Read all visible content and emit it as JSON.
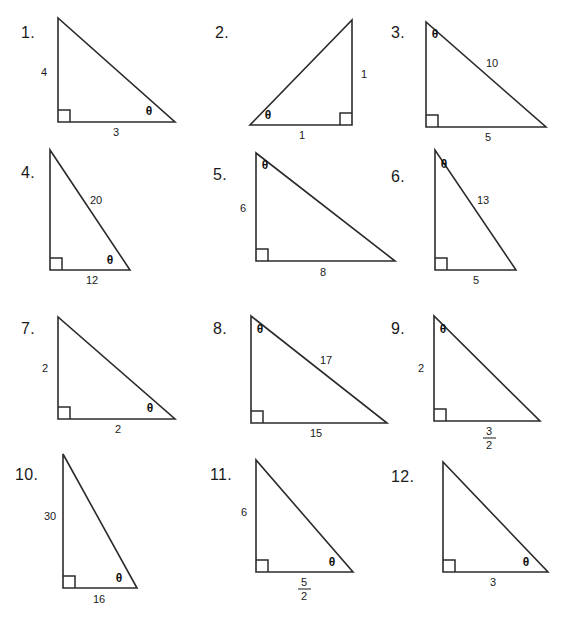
{
  "worksheet": {
    "title": "Right Triangle Trigonometry Practice",
    "theta_symbol": "θ",
    "problems": [
      {
        "number": "1.",
        "orientation": "right-angle-bottom-left",
        "theta_position": "bottom-right",
        "vertical_leg": "4",
        "horizontal_leg": "3",
        "hypotenuse": ""
      },
      {
        "number": "2.",
        "orientation": "right-angle-bottom-right",
        "theta_position": "bottom-left",
        "vertical_leg": "1",
        "horizontal_leg": "1",
        "hypotenuse": ""
      },
      {
        "number": "3.",
        "orientation": "right-angle-bottom-left",
        "theta_position": "top-left",
        "vertical_leg": "",
        "horizontal_leg": "5",
        "hypotenuse": "10"
      },
      {
        "number": "4.",
        "orientation": "right-angle-bottom-left",
        "theta_position": "bottom-right",
        "vertical_leg": "",
        "horizontal_leg": "12",
        "hypotenuse": "20"
      },
      {
        "number": "5.",
        "orientation": "right-angle-bottom-left",
        "theta_position": "top-left",
        "vertical_leg": "6",
        "horizontal_leg": "8",
        "hypotenuse": ""
      },
      {
        "number": "6.",
        "orientation": "right-angle-bottom-left",
        "theta_position": "top-left",
        "vertical_leg": "",
        "horizontal_leg": "5",
        "hypotenuse": "13"
      },
      {
        "number": "7.",
        "orientation": "right-angle-bottom-left",
        "theta_position": "bottom-right",
        "vertical_leg": "2",
        "horizontal_leg": "2",
        "hypotenuse": ""
      },
      {
        "number": "8.",
        "orientation": "right-angle-bottom-left",
        "theta_position": "top-left",
        "vertical_leg": "",
        "horizontal_leg": "15",
        "hypotenuse": "17"
      },
      {
        "number": "9.",
        "orientation": "right-angle-bottom-left",
        "theta_position": "top-left",
        "vertical_leg": "2",
        "horizontal_leg_numerator": "3",
        "horizontal_leg_denominator": "2",
        "hypotenuse": ""
      },
      {
        "number": "10.",
        "orientation": "right-angle-bottom-left",
        "theta_position": "bottom-right",
        "vertical_leg": "30",
        "horizontal_leg": "16",
        "hypotenuse": ""
      },
      {
        "number": "11.",
        "orientation": "right-angle-bottom-left",
        "theta_position": "bottom-right",
        "vertical_leg": "6",
        "horizontal_leg_numerator": "5",
        "horizontal_leg_denominator": "2",
        "hypotenuse": ""
      },
      {
        "number": "12.",
        "orientation": "right-angle-bottom-left",
        "theta_position": "bottom-right",
        "vertical_leg": "",
        "horizontal_leg": "3",
        "hypotenuse": ""
      }
    ],
    "colors": {
      "ink": "#2b2b2b",
      "text": "#1a1a1a",
      "background": "#ffffff"
    }
  }
}
